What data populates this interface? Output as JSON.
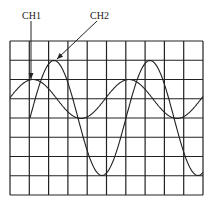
{
  "diagram": {
    "type": "oscilloscope-screen",
    "labels": {
      "ch1": "CH1",
      "ch2": "CH2"
    },
    "grid": {
      "x0": 10,
      "y0": 41,
      "x1": 203,
      "y1": 195,
      "columns": 10,
      "rows": 8
    },
    "channels": [
      {
        "name": "CH1",
        "shape": "sine",
        "center_y": 99,
        "amplitude_px": 19.5,
        "period_px": 96,
        "peak_x": [
          33,
          129
        ],
        "trough_x": [
          81,
          177
        ],
        "start_x": 10,
        "end_x": 203,
        "amplitude_divisions": 1,
        "period_divisions": 5
      },
      {
        "name": "CH2",
        "shape": "sine",
        "center_y": 118,
        "amplitude_px": 57.5,
        "period_px": 96,
        "peak_x": [
          54,
          150
        ],
        "trough_x": [
          102,
          198
        ],
        "start_x": 30,
        "end_x": 203,
        "amplitude_divisions": 3,
        "period_divisions": 5
      }
    ],
    "arrows": {
      "ch1": {
        "from": [
          31,
          21
        ],
        "to": [
          31,
          79
        ]
      },
      "ch2": {
        "from": [
          97,
          21
        ],
        "to": [
          57,
          59
        ]
      }
    },
    "colors": {
      "ink": "#222222",
      "background": "#ffffff"
    }
  }
}
